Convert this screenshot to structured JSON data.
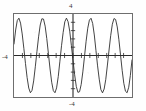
{
  "chart_data": {
    "type": "line",
    "title": "",
    "xlabel": "",
    "ylabel": "",
    "function": "y = 3.6 sin(4.4x)",
    "xlim": [
      -6.2831853,
      6.2831853
    ],
    "ylim": [
      -4,
      4
    ],
    "grid": false,
    "legend": "none",
    "axis_labels": {
      "y_max": "4",
      "y_min": "-4",
      "x_min": "-4",
      "x_max": ""
    },
    "x_axis_position": 0,
    "y_axis_position": 0,
    "x_tick_count": 13,
    "y_tick_count": 9,
    "amplitude": 3.6,
    "cycles_visible": 4.5,
    "peaks_count": 4,
    "troughs_count": 4,
    "points": [
      [
        -6.2832,
        1.11
      ],
      [
        -6.1087,
        2.46
      ],
      [
        -5.9341,
        3.37
      ],
      [
        -5.7596,
        3.6
      ],
      [
        -5.5851,
        3.12
      ],
      [
        -5.4105,
        2.08
      ],
      [
        -5.236,
        0.7
      ],
      [
        -5.0615,
        -0.77
      ],
      [
        -4.8869,
        -2.12
      ],
      [
        -4.7124,
        -3.14
      ],
      [
        -4.5379,
        -3.59
      ],
      [
        -4.3633,
        -3.36
      ],
      [
        -4.1888,
        -2.45
      ],
      [
        -4.0143,
        -1.09
      ],
      [
        -3.8397,
        0.39
      ],
      [
        -3.6652,
        1.8
      ],
      [
        -3.4907,
        2.94
      ],
      [
        -3.3161,
        3.54
      ],
      [
        -3.1416,
        3.51
      ],
      [
        -2.9671,
        2.83
      ],
      [
        -2.7925,
        1.64
      ],
      [
        -2.618,
        0.18
      ],
      [
        -2.4435,
        -1.3
      ],
      [
        -2.2689,
        -2.58
      ],
      [
        -2.0944,
        -3.39
      ],
      [
        -1.9199,
        -3.59
      ],
      [
        -1.7453,
        -3.12
      ],
      [
        -1.5708,
        -2.03
      ],
      [
        -1.3963,
        -0.55
      ],
      [
        -1.2217,
        0.94
      ],
      [
        -1.0472,
        2.23
      ],
      [
        -0.8727,
        3.25
      ],
      [
        -0.6981,
        3.6
      ],
      [
        -0.5236,
        3.26
      ],
      [
        -0.3491,
        2.35
      ],
      [
        -0.1745,
        0.98
      ],
      [
        0.0,
        -0.46
      ],
      [
        0.1745,
        -1.86
      ],
      [
        0.3491,
        -2.98
      ],
      [
        0.5236,
        -3.55
      ],
      [
        0.6981,
        -3.49
      ],
      [
        0.8727,
        -2.79
      ],
      [
        1.0472,
        -1.58
      ],
      [
        1.2217,
        -0.12
      ],
      [
        1.3963,
        1.37
      ],
      [
        1.5708,
        2.63
      ],
      [
        1.7453,
        3.41
      ],
      [
        1.9199,
        3.59
      ],
      [
        2.0944,
        3.09
      ],
      [
        2.2689,
        1.98
      ],
      [
        2.4435,
        0.49
      ],
      [
        2.618,
        -1.0
      ],
      [
        2.7925,
        -2.28
      ],
      [
        2.9671,
        -3.28
      ],
      [
        3.1416,
        -3.6
      ],
      [
        3.3161,
        -3.23
      ],
      [
        3.4907,
        -2.3
      ],
      [
        3.6652,
        -0.92
      ],
      [
        3.8397,
        0.53
      ],
      [
        4.0143,
        1.92
      ],
      [
        4.1888,
        3.01
      ],
      [
        4.3633,
        3.56
      ],
      [
        4.5379,
        3.47
      ],
      [
        4.7124,
        2.75
      ],
      [
        4.8869,
        1.52
      ],
      [
        5.0615,
        0.06
      ],
      [
        5.236,
        -1.43
      ],
      [
        5.4105,
        -2.68
      ],
      [
        5.5851,
        -3.44
      ],
      [
        5.7596,
        -3.59
      ],
      [
        5.9341,
        -3.06
      ],
      [
        6.1087,
        -1.93
      ],
      [
        6.2832,
        -0.43
      ]
    ]
  },
  "chart": {
    "frame_color": "#6e6e6e",
    "curve_color": "#2a2a2a",
    "axis_color": "#2a2a2a",
    "background": "#ffffff"
  }
}
